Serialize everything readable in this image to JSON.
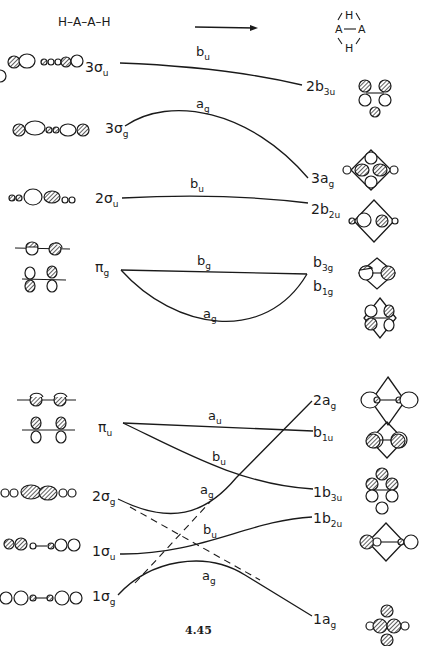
{
  "header": {
    "linear_molecule": "H–A–A–H",
    "cyclic_molecule": {
      "top": "H",
      "left": "A",
      "right": "A",
      "bottom": "H",
      "bond": "A—A"
    }
  },
  "figure_number": "4.45",
  "left_levels": [
    {
      "id": "3su",
      "main": "3σ",
      "sub": "u",
      "x": 85,
      "y": 72
    },
    {
      "id": "3sg",
      "main": "3σ",
      "sub": "g",
      "x": 105,
      "y": 133
    },
    {
      "id": "2su",
      "main": "2σ",
      "sub": "u",
      "x": 95,
      "y": 203
    },
    {
      "id": "pig",
      "main": "π",
      "sub": "g",
      "x": 95,
      "y": 272
    },
    {
      "id": "piu",
      "main": "π",
      "sub": "u",
      "x": 98,
      "y": 432
    },
    {
      "id": "2sg",
      "main": "2σ",
      "sub": "g",
      "x": 92,
      "y": 501
    },
    {
      "id": "1su",
      "main": "1σ",
      "sub": "u",
      "x": 92,
      "y": 556
    },
    {
      "id": "1sg",
      "main": "1σ",
      "sub": "g",
      "x": 92,
      "y": 601
    }
  ],
  "right_levels": [
    {
      "id": "2b3u",
      "main": "2b",
      "sub": "3u",
      "x": 306,
      "y": 91
    },
    {
      "id": "3ag",
      "main": "3a",
      "sub": "g",
      "x": 311,
      "y": 183
    },
    {
      "id": "2b2u",
      "main": "2b",
      "sub": "2u",
      "x": 311,
      "y": 214
    },
    {
      "id": "b3g",
      "main": "b",
      "sub": "3g",
      "x": 313,
      "y": 267
    },
    {
      "id": "b1g",
      "main": "b",
      "sub": "1g",
      "x": 313,
      "y": 291
    },
    {
      "id": "2ag",
      "main": "2a",
      "sub": "g",
      "x": 313,
      "y": 405
    },
    {
      "id": "b1u",
      "main": "b",
      "sub": "1u",
      "x": 313,
      "y": 437
    },
    {
      "id": "1b3u",
      "main": "1b",
      "sub": "3u",
      "x": 313,
      "y": 497
    },
    {
      "id": "1b2u",
      "main": "1b",
      "sub": "2u",
      "x": 313,
      "y": 523
    },
    {
      "id": "1ag",
      "main": "1a",
      "sub": "g",
      "x": 313,
      "y": 624
    }
  ],
  "correlations": [
    {
      "from": "3su",
      "to": "2b3u",
      "symmetry": "b",
      "symmetry_sub": "u",
      "path": "M120,63 C200,66 260,75 302,85",
      "label_x": 196,
      "label_y": 56
    },
    {
      "from": "3sg",
      "to": "3ag",
      "symmetry": "a",
      "symmetry_sub": "g",
      "path": "M125,126 C170,95 250,110 308,178",
      "label_x": 196,
      "label_y": 108
    },
    {
      "from": "2su",
      "to": "2b2u",
      "symmetry": "b",
      "symmetry_sub": "u",
      "path": "M122,198 C200,194 260,197 308,203",
      "label_x": 190,
      "label_y": 188
    },
    {
      "from": "pig",
      "to": "b3g",
      "symmetry": "b",
      "symmetry_sub": "g",
      "path": "M121,270 L307,274",
      "label_x": 197,
      "label_y": 265
    },
    {
      "from": "pig",
      "to": "b1g",
      "symmetry": "a",
      "symmetry_sub": "g",
      "path": "M121,270 C175,330 265,345 307,274",
      "label_x": 203,
      "label_y": 318
    },
    {
      "from": "piu",
      "to": "b1u",
      "symmetry": "a",
      "symmetry_sub": "u",
      "path": "M123,423 L313,431",
      "label_x": 208,
      "label_y": 420
    },
    {
      "from": "piu",
      "to": "1b3u",
      "symmetry": "b",
      "symmetry_sub": "u",
      "path": "M123,423 C180,450 240,485 313,489",
      "label_x": 212,
      "label_y": 461
    },
    {
      "from": "2sg",
      "to": "2ag",
      "symmetry": "a",
      "symmetry_sub": "g",
      "path": "M118,499 C170,525 205,515 236,478 L312,401",
      "label_x": 200,
      "label_y": 494
    },
    {
      "from": "1su",
      "to": "1b2u",
      "symmetry": "b",
      "symmetry_sub": "u",
      "path": "M120,554 C200,555 250,520 312,517",
      "label_x": 203,
      "label_y": 534
    },
    {
      "from": "1sg",
      "to": "1ag",
      "symmetry": "a",
      "symmetry_sub": "g",
      "path": "M118,595 C150,560 205,550 245,575 L312,616",
      "label_x": 202,
      "label_y": 580
    }
  ],
  "non_crossing_dashed": [
    {
      "from": "2sg",
      "to": "1ag_direction",
      "path": "M130,507 L260,580"
    },
    {
      "from": "1sg",
      "to": "2ag_direction",
      "path": "M135,583 L210,502"
    }
  ],
  "colors": {
    "ink": "#1a1a1a",
    "background": "#ffffff"
  }
}
